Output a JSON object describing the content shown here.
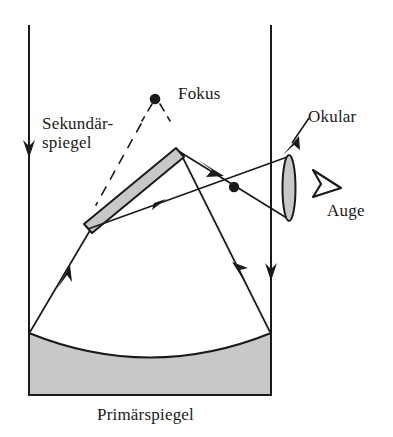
{
  "figure": {
    "type": "optical-ray-diagram",
    "background_color": "#ffffff",
    "stroke_color": "#1a1a1a",
    "mirror_fill_color": "#c8c8c8",
    "labels": {
      "fokus": "Fokus",
      "okular": "Okular",
      "auge": "Auge",
      "sekundaerspiegel_line1": "Sekundär-",
      "sekundaerspiegel_line2": "spiegel",
      "primaerspiegel": "Primärspiegel"
    },
    "components": [
      {
        "name": "primary-mirror",
        "label": "Primärspiegel",
        "shape": "concave-filled-block",
        "fill": "#c8c8c8"
      },
      {
        "name": "secondary-mirror",
        "label": "Sekundärspiegel",
        "shape": "tilted-flat-bar",
        "fill": "#c8c8c8"
      },
      {
        "name": "eyepiece-lens",
        "label": "Okular",
        "shape": "thin-vertical-lens",
        "fill": "#c8c8c8"
      },
      {
        "name": "focus-point",
        "label": "Fokus",
        "shape": "filled-dot"
      },
      {
        "name": "eye-symbol",
        "label": "Auge",
        "shape": "outlined-triangle"
      },
      {
        "name": "telescope-tube",
        "label": "",
        "shape": "two-vertical-walls"
      }
    ],
    "rays": [
      {
        "name": "incoming-ray-left",
        "direction": "down",
        "arrow": "down"
      },
      {
        "name": "incoming-ray-right",
        "direction": "down",
        "arrow": "down"
      },
      {
        "name": "reflected-ray-left",
        "direction": "up-right",
        "arrow": "up-right"
      },
      {
        "name": "reflected-ray-right",
        "direction": "up-left",
        "arrow": "up-left"
      },
      {
        "name": "secondary-to-eyepiece-upper",
        "direction": "right",
        "arrow": "right"
      },
      {
        "name": "secondary-to-eyepiece-lower",
        "direction": "right",
        "arrow": "right"
      }
    ]
  }
}
